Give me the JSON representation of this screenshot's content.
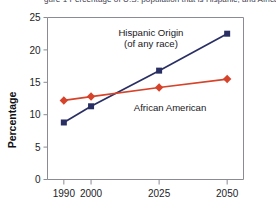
{
  "caption": {
    "clipped_top_text": "gure 1  Percentage of U.S. population that is Hispanic, and African"
  },
  "chart_data": {
    "type": "line",
    "title": "",
    "xlabel": "",
    "ylabel": "Percentage",
    "categories": [
      "1990",
      "2000",
      "2025",
      "2050"
    ],
    "x": [
      1990,
      2000,
      2025,
      2050
    ],
    "xlim": [
      1984,
      2056
    ],
    "ylim": [
      0,
      25
    ],
    "yticks": [
      0,
      5,
      10,
      15,
      20,
      25
    ],
    "ytick_labels": [
      "0",
      "5",
      "10",
      "15",
      "20",
      "25"
    ],
    "grid": false,
    "legend_position": "inline-annotations",
    "series": [
      {
        "name": "Hispanic Origin (of any race)",
        "values": [
          8.8,
          11.3,
          16.8,
          22.5
        ],
        "color": "#2a2f63",
        "marker": "square"
      },
      {
        "name": "African American",
        "values": [
          12.2,
          12.8,
          14.2,
          15.5
        ],
        "color": "#d6432a",
        "marker": "diamond"
      }
    ],
    "annotations": [
      {
        "text": "Hispanic Origin",
        "x": 2022,
        "y": 22.2
      },
      {
        "text": "(of any race)",
        "x": 2022,
        "y": 20.4
      },
      {
        "text": "African American",
        "x": 2029,
        "y": 10.6
      }
    ]
  },
  "colors": {
    "hispanic_navy": "#2a2f63",
    "african_american_red": "#d6432a",
    "axis_gray": "#8b8b93",
    "text_dark": "#17171c",
    "background": "#ffffff"
  }
}
